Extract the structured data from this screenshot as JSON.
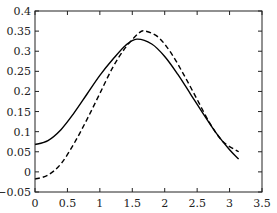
{
  "chart_data": {
    "type": "line",
    "title": "",
    "xlabel": "",
    "ylabel": "",
    "xlim": [
      0,
      3.5
    ],
    "ylim": [
      -0.05,
      0.4
    ],
    "grid": false,
    "legend": null,
    "xticks": [
      0,
      0.5,
      1,
      1.5,
      2,
      2.5,
      3,
      3.5
    ],
    "xtick_labels": [
      "0",
      "0.5",
      "1",
      "1.5",
      "2",
      "2.5",
      "3",
      "3.5"
    ],
    "yticks": [
      -0.05,
      0,
      0.05,
      0.1,
      0.15,
      0.2,
      0.25,
      0.3,
      0.35,
      0.4
    ],
    "ytick_labels": [
      "−0.05",
      "0",
      "0.05",
      "0.1",
      "0.15",
      "0.2",
      "0.25",
      "0.3",
      "0.35",
      "0.4"
    ],
    "series": [
      {
        "name": "solid",
        "style": "solid",
        "color": "#000000",
        "x": [
          0,
          0.2,
          0.4,
          0.6,
          0.8,
          1.0,
          1.2,
          1.4,
          1.57,
          1.8,
          2.0,
          2.2,
          2.4,
          2.6,
          2.8,
          3.0,
          3.14
        ],
        "y": [
          0.068,
          0.078,
          0.105,
          0.146,
          0.193,
          0.24,
          0.28,
          0.315,
          0.33,
          0.318,
          0.287,
          0.243,
          0.193,
          0.143,
          0.095,
          0.055,
          0.032
        ]
      },
      {
        "name": "dashed",
        "style": "dashed",
        "color": "#000000",
        "x": [
          0,
          0.2,
          0.4,
          0.6,
          0.8,
          1.0,
          1.2,
          1.4,
          1.6,
          1.7,
          1.9,
          2.1,
          2.3,
          2.5,
          2.7,
          2.9,
          3.14
        ],
        "y": [
          -0.018,
          -0.008,
          0.02,
          0.07,
          0.13,
          0.195,
          0.26,
          0.31,
          0.345,
          0.35,
          0.335,
          0.295,
          0.24,
          0.18,
          0.12,
          0.075,
          0.05
        ]
      }
    ]
  }
}
